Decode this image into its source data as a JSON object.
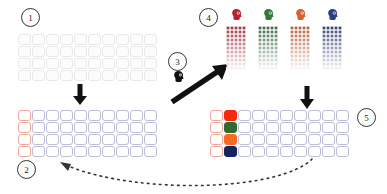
{
  "figure": {
    "background": "#ffffff"
  },
  "markers": [
    {
      "id": "m1",
      "label": "1"
    },
    {
      "id": "m2",
      "label": "2"
    },
    {
      "id": "m3",
      "label": "3"
    },
    {
      "id": "m4",
      "label": "4"
    },
    {
      "id": "m5",
      "label": "5"
    }
  ],
  "palette": {
    "red": "#f5290d",
    "green": "#2f6b33",
    "orange": "#f96a22",
    "navy": "#15265e",
    "red_outline": "#eda79c",
    "blue_outline": "#b9bfd8",
    "faint_outline": "#e8e8ea",
    "arrow": "#111111"
  },
  "grid_empty": {
    "name": "empty-grid",
    "columns": 10,
    "rows": 4,
    "cell_style": "faint",
    "caption": "1"
  },
  "grid_outlined": {
    "name": "outlined-grid",
    "columns": 10,
    "rows": 4,
    "first_column_style": "red-out",
    "other_column_style": "blue-out",
    "caption": "2"
  },
  "grid_filled": {
    "name": "filled-grid",
    "columns": 10,
    "rows": 4,
    "first_column_style": "red-out",
    "second_column_fills": [
      "fill-red",
      "fill-green",
      "fill-orange",
      "fill-navy"
    ],
    "other_column_style": "blue-out",
    "caption": "5"
  },
  "agent_columns": {
    "name": "agent-dot-columns",
    "caption": "4",
    "dot_columns": 4,
    "dot_rows": 14,
    "dots_per_row": 5,
    "items": [
      {
        "id": "agent-red",
        "icon": "head-icon",
        "color": "#b4202e",
        "tint_top": "#8e1322",
        "tint_bottom": "#ffffff",
        "filled_rows": 9
      },
      {
        "id": "agent-green",
        "icon": "head-icon",
        "color": "#2f7a36",
        "tint_top": "#1d4f28",
        "tint_bottom": "#ffffff",
        "filled_rows": 9
      },
      {
        "id": "agent-orange",
        "icon": "head-icon",
        "color": "#d4622c",
        "tint_top": "#a8421c",
        "tint_bottom": "#ffffff",
        "filled_rows": 9
      },
      {
        "id": "agent-navy",
        "icon": "head-icon",
        "color": "#2b3f86",
        "tint_top": "#14215e",
        "tint_bottom": "#ffffff",
        "filled_rows": 9
      }
    ]
  },
  "step3": {
    "name": "step-3-cluster",
    "caption": "3",
    "icon": "head-icon-dark",
    "icon_color": "#111111",
    "arrow": "diagonal-up-right-arrow"
  },
  "arrows": [
    {
      "id": "arrow-down-left",
      "name": "down-arrow-left",
      "direction": "down"
    },
    {
      "id": "arrow-diagonal",
      "name": "diagonal-arrow",
      "direction": "up-right"
    },
    {
      "id": "arrow-down-right",
      "name": "down-arrow-right",
      "direction": "down"
    },
    {
      "id": "arrow-feedback",
      "name": "dashed-feedback-arrow",
      "direction": "left",
      "style": "dashed"
    }
  ]
}
